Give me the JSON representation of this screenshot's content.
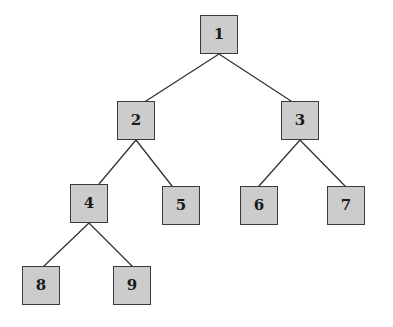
{
  "diagram": {
    "type": "binary-tree",
    "background_color": "#ffffff",
    "node_fill_color": "#cccccc",
    "node_border_color": "#3a3a3a",
    "edge_color": "#333333",
    "node_width": 38,
    "node_height": 39,
    "nodes": [
      {
        "id": "1",
        "label": "1",
        "x": 200,
        "y": 15,
        "level": 0,
        "parent": null
      },
      {
        "id": "2",
        "label": "2",
        "x": 117,
        "y": 101,
        "level": 1,
        "parent": "1"
      },
      {
        "id": "3",
        "label": "3",
        "x": 281,
        "y": 101,
        "level": 1,
        "parent": "1"
      },
      {
        "id": "4",
        "label": "4",
        "x": 70,
        "y": 184,
        "level": 2,
        "parent": "2"
      },
      {
        "id": "5",
        "label": "5",
        "x": 162,
        "y": 186,
        "level": 2,
        "parent": "2"
      },
      {
        "id": "6",
        "label": "6",
        "x": 240,
        "y": 186,
        "level": 2,
        "parent": "3"
      },
      {
        "id": "7",
        "label": "7",
        "x": 327,
        "y": 186,
        "level": 2,
        "parent": "3"
      },
      {
        "id": "8",
        "label": "8",
        "x": 22,
        "y": 266,
        "level": 3,
        "parent": "4"
      },
      {
        "id": "9",
        "label": "9",
        "x": 113,
        "y": 266,
        "level": 3,
        "parent": "4"
      }
    ],
    "edges": [
      {
        "from": "1",
        "to": "2",
        "x1": 219,
        "y1": 54,
        "x2": 146,
        "y2": 101
      },
      {
        "from": "1",
        "to": "3",
        "x1": 219,
        "y1": 54,
        "x2": 291,
        "y2": 101
      },
      {
        "from": "2",
        "to": "4",
        "x1": 136,
        "y1": 140,
        "x2": 99,
        "y2": 184
      },
      {
        "from": "2",
        "to": "5",
        "x1": 136,
        "y1": 140,
        "x2": 172,
        "y2": 186
      },
      {
        "from": "3",
        "to": "6",
        "x1": 300,
        "y1": 140,
        "x2": 259,
        "y2": 186
      },
      {
        "from": "3",
        "to": "7",
        "x1": 300,
        "y1": 140,
        "x2": 345,
        "y2": 186
      },
      {
        "from": "4",
        "to": "8",
        "x1": 89,
        "y1": 223,
        "x2": 44,
        "y2": 266
      },
      {
        "from": "4",
        "to": "9",
        "x1": 89,
        "y1": 223,
        "x2": 132,
        "y2": 266
      }
    ]
  }
}
